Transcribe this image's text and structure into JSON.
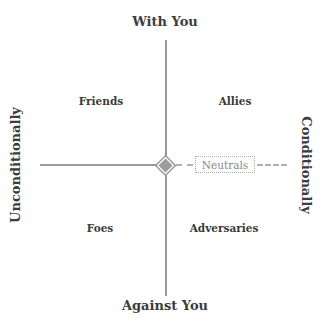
{
  "axes": {
    "top": "With You",
    "bottom": "Against You",
    "left": "Unconditionally",
    "right": "Conditionally"
  },
  "quadrants": {
    "top_left": "Friends",
    "top_right": "Allies",
    "bottom_left": "Foes",
    "bottom_right": "Adversaries"
  },
  "center_label": "Neutrals",
  "colors": {
    "axis_line": "#9a9a9a",
    "text": "#3a3a3a",
    "neutral_text": "#8a8a8a"
  }
}
